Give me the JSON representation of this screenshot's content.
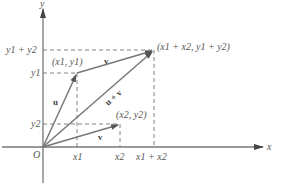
{
  "figure": {
    "axes": {
      "x_label": "x",
      "y_label": "y",
      "origin_label": "O"
    },
    "x_ticks": [
      {
        "label_base": "x",
        "label_sub": "1",
        "text": "x1"
      },
      {
        "label_base": "x",
        "label_sub": "2",
        "text": "x2"
      },
      {
        "text": "x1 + x2"
      }
    ],
    "y_ticks": [
      {
        "text": "y1 + y2"
      },
      {
        "text": "y1"
      },
      {
        "text": "y2"
      }
    ],
    "points": [
      {
        "name": "u_tip",
        "text": "(x1, y1)"
      },
      {
        "name": "v_tip",
        "text": "(x2, y2)"
      },
      {
        "name": "sum_tip",
        "text": "(x1 + x2, y1 + y2)"
      }
    ],
    "vectors": [
      {
        "name": "u",
        "label": "u",
        "from": "O",
        "to": "(x1, y1)"
      },
      {
        "name": "v-translated",
        "label": "v",
        "from": "(x1, y1)",
        "to": "(x1 + x2, y1 + y2)"
      },
      {
        "name": "v",
        "label": "v",
        "from": "O",
        "to": "(x2, y2)"
      },
      {
        "name": "u-plus-v",
        "label": "u + v",
        "from": "O",
        "to": "(x1 + x2, y1 + y2)"
      }
    ],
    "colors": {
      "line": "#777777",
      "text": "#555555",
      "background": "#ffffff"
    }
  }
}
